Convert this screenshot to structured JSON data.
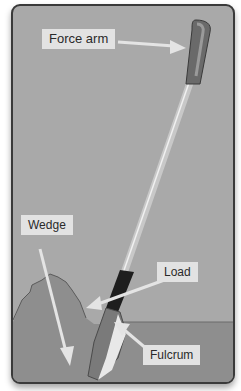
{
  "diagram": {
    "labels": {
      "force_arm": "Force arm",
      "wedge": "Wedge",
      "load": "Load",
      "fulcrum": "Fulcrum"
    },
    "colors": {
      "background": "#a9a9a9",
      "ground": "#8e8e8e",
      "label_bg": "#e2e2e2",
      "border": "#3a3a3a",
      "handle_grip": "#6a6a6a",
      "shaft": "#c8c8c8",
      "collar": "#1e1e1e",
      "arrow": "#e4e4e4"
    }
  }
}
